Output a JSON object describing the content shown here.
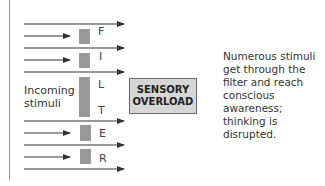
{
  "diagram": {
    "filter_letters": [
      "F",
      "I",
      "L",
      "T",
      "E",
      "R"
    ],
    "incoming_label": [
      "Incoming",
      "stimuli"
    ],
    "overload_box": [
      "SENSORY",
      "OVERLOAD"
    ],
    "note": [
      "Numerous stimuli",
      "get through the",
      "filter and reach",
      "conscious",
      "awareness;",
      "thinking is",
      "disrupted."
    ],
    "colors": {
      "filter_block": "#999999",
      "overload_fill": "#d6d6d6",
      "arrow": "#333333"
    }
  }
}
